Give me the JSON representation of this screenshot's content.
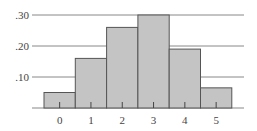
{
  "chart_data": {
    "type": "bar",
    "title": "",
    "xlabel": "",
    "ylabel": "",
    "categories": [
      "0",
      "1",
      "2",
      "3",
      "4",
      "5"
    ],
    "values": [
      0.05,
      0.16,
      0.26,
      0.3,
      0.19,
      0.065
    ],
    "ylim": [
      0,
      0.3
    ],
    "yticks": [
      ".10",
      ".20",
      ".30"
    ],
    "ytick_values": [
      0.1,
      0.2,
      0.3
    ],
    "grid": true,
    "legend": null,
    "bar_style": "histogram (adjacent bars)",
    "colors": {
      "bar_fill": "#c4c4c4",
      "bar_edge": "#555555",
      "grid": "#888888",
      "text": "#444444"
    }
  }
}
